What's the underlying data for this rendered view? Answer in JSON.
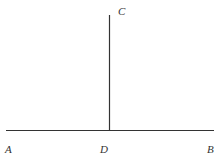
{
  "diagram": {
    "points": {
      "A": {
        "label": "A",
        "x": 8,
        "y": 152
      },
      "B": {
        "label": "B",
        "x": 210,
        "y": 152
      },
      "C": {
        "label": "C",
        "x": 118,
        "y": 15
      },
      "D": {
        "label": "D",
        "x": 101,
        "y": 152
      }
    },
    "segments": [
      {
        "from": "A",
        "to": "B"
      },
      {
        "from": "D",
        "to": "C"
      }
    ],
    "line_color": "#333333"
  }
}
